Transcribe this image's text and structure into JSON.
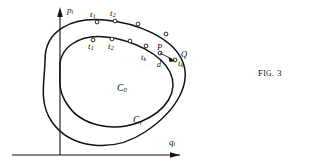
{
  "figure": {
    "caption_prefix": "F",
    "caption_small": "IG",
    "caption_suffix": ". 3",
    "caption_full": "FIG. 3",
    "background_color": "#ffffff",
    "ink_color": "#111111"
  },
  "axes": {
    "y_label": "p",
    "y_label_sub": "i",
    "x_label": "q",
    "x_label_sub": "i"
  },
  "curves": [
    {
      "id": "outer",
      "label": "C",
      "label_sub": "γ",
      "label_x": 141,
      "label_y": 120
    },
    {
      "id": "inner",
      "label": "C",
      "label_sub": "0",
      "label_x": 118,
      "label_y": 89
    }
  ],
  "outer_labels": [
    {
      "text": "t",
      "sub": "1",
      "x": 90,
      "y": 12
    },
    {
      "text": "t",
      "sub": "2",
      "x": 110,
      "y": 11
    }
  ],
  "inner_labels": [
    {
      "text": "t",
      "sub": "1",
      "x": 88,
      "y": 43
    },
    {
      "text": "t",
      "sub": "2",
      "x": 108,
      "y": 42
    }
  ],
  "point_labels": [
    {
      "name": "P",
      "text": "P",
      "sub": "",
      "x": 157,
      "y": 48
    },
    {
      "name": "tk",
      "text": "t",
      "sub": "k",
      "x": 143,
      "y": 58
    },
    {
      "name": "Q",
      "text": "Q",
      "sub": "",
      "x": 180,
      "y": 54
    },
    {
      "name": "tk2",
      "text": "t",
      "sub": "k",
      "x": 177,
      "y": 62
    },
    {
      "name": "d",
      "text": "d",
      "sub": "",
      "x": 158,
      "y": 63
    }
  ],
  "markers": {
    "outer": [
      {
        "cx": 97,
        "cy": 22
      },
      {
        "cx": 115,
        "cy": 21
      },
      {
        "cx": 138,
        "cy": 24
      },
      {
        "cx": 168,
        "cy": 35
      }
    ],
    "inner": [
      {
        "cx": 93,
        "cy": 40
      },
      {
        "cx": 112,
        "cy": 39
      },
      {
        "cx": 130,
        "cy": 41
      },
      {
        "cx": 146,
        "cy": 46
      }
    ],
    "detail": [
      {
        "cx": 162,
        "cy": 52
      },
      {
        "cx": 173,
        "cy": 60
      }
    ]
  }
}
